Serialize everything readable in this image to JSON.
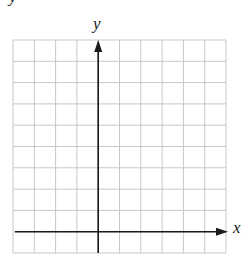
{
  "diagram": {
    "type": "coordinate-grid",
    "x_axis_label": "x",
    "y_axis_label": "y",
    "corner_fragment": "y",
    "grid": {
      "columns": 10,
      "rows": 10,
      "left": 13,
      "top": 40,
      "cell_size": 21.3,
      "line_color": "#c8c8c8",
      "axis_color": "#1a1a1a"
    },
    "origin": {
      "column_index": 4,
      "row_index": 9
    },
    "axes": {
      "x_arrow": "right",
      "y_arrow": "up"
    }
  }
}
